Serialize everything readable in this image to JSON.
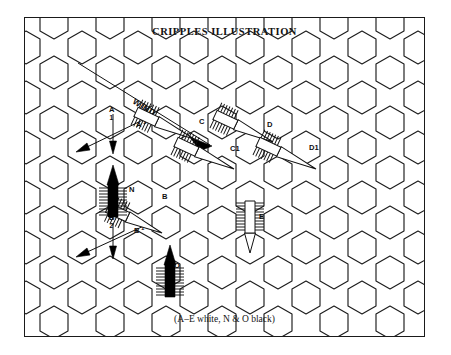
{
  "page": {
    "title": "CRIPPLES ILLUSTRATION",
    "caption": "(A–E white, N & O black)",
    "width": 451,
    "height": 355,
    "background_color": "#ffffff",
    "border_color": "#1a1a1a"
  },
  "diagram": {
    "type": "hexagonal-cell-arrow-diagram",
    "grid": {
      "shape": "hexagon",
      "hex_radius": 29,
      "columns": 9,
      "rows": 6,
      "line_color": "#1d1d1d",
      "line_width": 1.15
    },
    "wind": {
      "label": "WIND",
      "direction": "down-right",
      "angle_degrees": 36,
      "arrow_start": {
        "x": 78,
        "y": 48
      },
      "arrow_end": {
        "x": 205,
        "y": 140
      }
    },
    "arrows": [
      {
        "id": "A",
        "label": "A",
        "sublabel": "1",
        "style": "thin-line-with-black-head",
        "fill": "white",
        "direction": "down-left",
        "label_position": {
          "x": 104,
          "y": 106
        }
      },
      {
        "id": "A1",
        "label": "A¹",
        "label_text": "A1",
        "style": "thin-line-with-black-head",
        "fill": "white",
        "direction": "down-left",
        "label_position": {
          "x": 132,
          "y": 127
        }
      },
      {
        "id": "B",
        "label": "B",
        "sublabel": "2",
        "style": "thin-line-with-black-head",
        "fill": "white",
        "direction": "down-left",
        "label_position": {
          "x": 104,
          "y": 214
        }
      },
      {
        "id": "B1",
        "label": "B¹",
        "label_text": "B1",
        "style": "thin-line-with-black-head",
        "fill": "white",
        "direction": "down-left",
        "label_position": {
          "x": 130,
          "y": 233
        }
      },
      {
        "id": "B-hatched",
        "label": "B",
        "style": "hollow-hatched-arrow",
        "fill": "white",
        "direction": "down-left",
        "label_position": {
          "x": 160,
          "y": 196
        }
      },
      {
        "id": "C",
        "label": "C",
        "style": "hollow-hatched-arrow",
        "fill": "white",
        "direction": "down-left",
        "label_position": {
          "x": 197,
          "y": 121
        }
      },
      {
        "id": "C1",
        "label": "C1",
        "style": "hollow-hatched-arrow",
        "fill": "white",
        "direction": "down-left",
        "label_position": {
          "x": 233,
          "y": 149
        }
      },
      {
        "id": "D",
        "label": "D",
        "style": "hollow-hatched-arrow",
        "fill": "white",
        "direction": "down-left",
        "label_position": {
          "x": 270,
          "y": 124
        }
      },
      {
        "id": "D1",
        "label": "D1",
        "style": "hollow-hatched-arrow",
        "fill": "white",
        "direction": "down-left",
        "label_position": {
          "x": 316,
          "y": 146
        }
      },
      {
        "id": "E",
        "label": "E",
        "style": "hollow-hatched-arrow",
        "fill": "white",
        "direction": "down",
        "label_position": {
          "x": 261,
          "y": 215
        }
      },
      {
        "id": "N",
        "label": "N",
        "style": "solid-black-hatched-arrow",
        "fill": "black",
        "direction": "up",
        "label_position": {
          "x": 131,
          "y": 188
        }
      },
      {
        "id": "O",
        "label": "O",
        "style": "solid-black-hatched-arrow",
        "fill": "black",
        "direction": "up",
        "label_position": {
          "x": 174,
          "y": 263
        }
      }
    ],
    "legend": {
      "white_arrows": "A–E",
      "black_arrows": "N & O"
    }
  }
}
